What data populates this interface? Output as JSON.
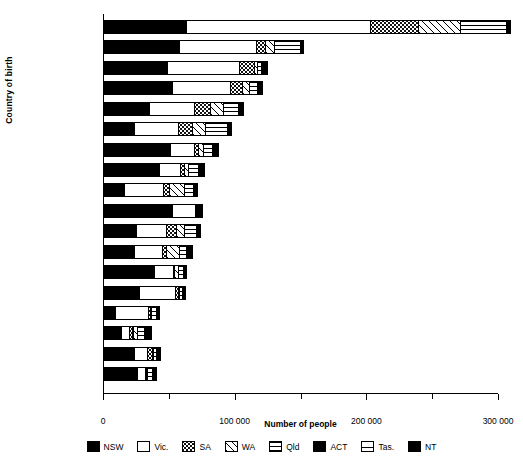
{
  "chart_data": {
    "type": "bar",
    "orientation": "horizontal",
    "stacked": true,
    "title": "",
    "xlabel": "Number of people",
    "ylabel": "Country of birth",
    "xlim": [
      0,
      300000
    ],
    "xticks": [
      0,
      50000,
      100000,
      150000,
      200000,
      250000,
      300000
    ],
    "xticklabels": [
      "0",
      "",
      "100 000",
      "",
      "200 000",
      "",
      "300 000"
    ],
    "grid": false,
    "legend_position": "bottom",
    "categories": [
      "Italy",
      "Yugoslavia",
      "Greece",
      "Vietnam",
      "Germany",
      "Netherlands",
      "China",
      "Philippines",
      "Malaysia",
      "Lebanon",
      "Poland",
      "India",
      "Hong Kong",
      "Malta",
      "Sri Lanka",
      "Indonesia",
      "Egypt",
      "Fiji"
    ],
    "series": [
      {
        "name": "NSW",
        "pattern": "solid-black",
        "values": [
          64000,
          58500,
          49500,
          53000,
          35500,
          24500,
          51500,
          43000,
          16500,
          53000,
          26000,
          24500,
          39500,
          28000,
          9500,
          14000,
          24000,
          26500
        ]
      },
      {
        "name": "Vic.",
        "pattern": "white",
        "values": [
          140500,
          59000,
          55500,
          45000,
          35000,
          34000,
          19000,
          17000,
          30500,
          18500,
          23000,
          21500,
          15000,
          28000,
          26000,
          7000,
          10500,
          6500
        ]
      },
      {
        "name": "SA",
        "pattern": "dots",
        "values": [
          37000,
          7500,
          12000,
          9500,
          13000,
          11500,
          3500,
          3500,
          5500,
          1500,
          8500,
          4000,
          1500,
          3000,
          2500,
          3500,
          5000,
          1500
        ]
      },
      {
        "name": "WA",
        "pattern": "diagonal",
        "values": [
          32500,
          7500,
          3000,
          6000,
          10500,
          10000,
          4500,
          3500,
          12000,
          1000,
          7000,
          10500,
          3500,
          1500,
          1000,
          4000,
          1500,
          1500
        ]
      },
      {
        "name": "Qld",
        "pattern": "horizontal",
        "values": [
          35500,
          20500,
          3500,
          7000,
          12000,
          18000,
          8000,
          8500,
          7500,
          1500,
          9500,
          6000,
          4500,
          3000,
          4000,
          6000,
          3000,
          5000
        ]
      },
      {
        "name": "ACT",
        "pattern": "solid-black",
        "values": [
          2000,
          1500,
          1500,
          2500,
          2000,
          2000,
          2500,
          2000,
          1500,
          1000,
          2000,
          2500,
          1500,
          1000,
          1500,
          1000,
          1500,
          1000
        ]
      },
      {
        "name": "Tas.",
        "pattern": "tas",
        "values": [
          1500,
          1000,
          1000,
          1000,
          1500,
          1500,
          500,
          500,
          500,
          500,
          1000,
          500,
          500,
          500,
          500,
          500,
          500,
          500
        ]
      },
      {
        "name": "NT",
        "pattern": "solid-black",
        "values": [
          1500,
          1000,
          3500,
          1000,
          2000,
          1500,
          2000,
          3500,
          2000,
          1000,
          1000,
          2500,
          1000,
          1000,
          1500,
          4500,
          1000,
          1500
        ]
      }
    ],
    "totals": [
      314500,
      156500,
      129500,
      125000,
      111500,
      103000,
      91500,
      81500,
      76000,
      78000,
      78000,
      72000,
      67000,
      66000,
      46500,
      40500,
      47000,
      44000
    ]
  },
  "legend": {
    "items": [
      {
        "label": "NSW",
        "pattern": "solid-black"
      },
      {
        "label": "Vic.",
        "pattern": "white"
      },
      {
        "label": "SA",
        "pattern": "dots"
      },
      {
        "label": "WA",
        "pattern": "diagonal"
      },
      {
        "label": "Qld",
        "pattern": "horizontal"
      },
      {
        "label": "ACT",
        "pattern": "solid-black"
      },
      {
        "label": "Tas.",
        "pattern": "tas"
      },
      {
        "label": "NT",
        "pattern": "solid-black"
      }
    ]
  },
  "colors": {
    "ink": "#000000",
    "paper": "#ffffff"
  }
}
